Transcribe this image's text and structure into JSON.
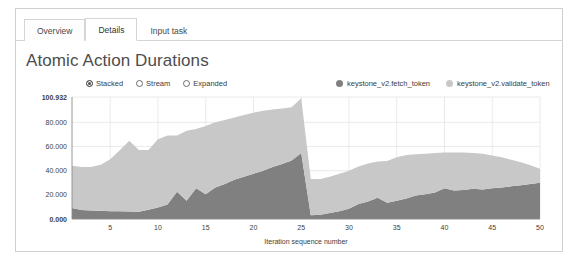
{
  "tabs": [
    {
      "label": "Overview",
      "state": "inactive-boxed"
    },
    {
      "label": "Details",
      "state": "active"
    },
    {
      "label": "Input task",
      "state": "plain"
    }
  ],
  "chart_title": "Atomic Action Durations",
  "mode_controls": [
    {
      "label": "Stacked",
      "selected": true
    },
    {
      "label": "Stream",
      "selected": false
    },
    {
      "label": "Expanded",
      "selected": false
    }
  ],
  "colors": {
    "fetch_token": "#808080",
    "validate_token": "#c8c8c8",
    "grid": "#e4e4e4",
    "axis": "#8a8a8a",
    "panel_border": "#cfcfcf",
    "title_text": "#4d4d4d"
  },
  "chart_data": {
    "type": "area",
    "stacked": true,
    "title": "Atomic Action Durations",
    "xlabel": "Iteration sequence number",
    "ylabel": "",
    "xlim": [
      1,
      50
    ],
    "ylim": [
      0,
      100.932
    ],
    "grid": true,
    "legend_position": "top-right",
    "ytick_labels": [
      "100.932",
      "80.000",
      "60.000",
      "40.000",
      "20.000",
      "0.000"
    ],
    "ytick_values": [
      100.932,
      80.0,
      60.0,
      40.0,
      20.0,
      0.0
    ],
    "xtick_values": [
      5,
      10,
      15,
      20,
      25,
      30,
      35,
      40,
      45,
      50
    ],
    "x": [
      1,
      2,
      3,
      4,
      5,
      6,
      7,
      8,
      9,
      10,
      11,
      12,
      13,
      14,
      15,
      16,
      17,
      18,
      19,
      20,
      21,
      22,
      23,
      24,
      25,
      26,
      27,
      28,
      29,
      30,
      31,
      32,
      33,
      34,
      35,
      36,
      37,
      38,
      39,
      40,
      41,
      42,
      43,
      44,
      45,
      46,
      47,
      48,
      49,
      50
    ],
    "series": [
      {
        "name": "keystone_v2.fetch_token",
        "color": "#808080",
        "values": [
          9.0,
          7.5,
          7.0,
          6.8,
          6.5,
          6.4,
          6.2,
          6.0,
          7.6,
          9.5,
          12.0,
          22.5,
          15.0,
          25.5,
          20.5,
          26.0,
          29.0,
          32.5,
          35.0,
          37.5,
          40.0,
          43.0,
          45.5,
          48.5,
          54.5,
          3.0,
          3.5,
          5.0,
          6.5,
          8.5,
          12.5,
          14.5,
          17.5,
          13.5,
          15.0,
          17.0,
          19.5,
          20.5,
          22.0,
          25.5,
          23.5,
          24.0,
          25.0,
          24.5,
          25.5,
          26.0,
          27.0,
          28.0,
          29.0,
          30.0
        ]
      },
      {
        "name": "keystone_v2.validate_token",
        "color": "#c8c8c8",
        "values": [
          35.0,
          35.5,
          36.0,
          38.0,
          43.0,
          50.5,
          58.5,
          51.0,
          49.5,
          56.5,
          57.0,
          46.5,
          58.0,
          49.0,
          56.5,
          54.0,
          53.0,
          51.5,
          51.0,
          50.5,
          49.5,
          47.5,
          46.0,
          44.0,
          45.5,
          30.0,
          29.5,
          30.0,
          31.0,
          31.5,
          31.0,
          31.5,
          30.0,
          34.5,
          36.0,
          36.0,
          34.0,
          33.5,
          32.5,
          29.5,
          31.5,
          31.0,
          29.5,
          29.5,
          27.0,
          25.0,
          22.0,
          19.0,
          15.5,
          11.5
        ]
      }
    ]
  }
}
